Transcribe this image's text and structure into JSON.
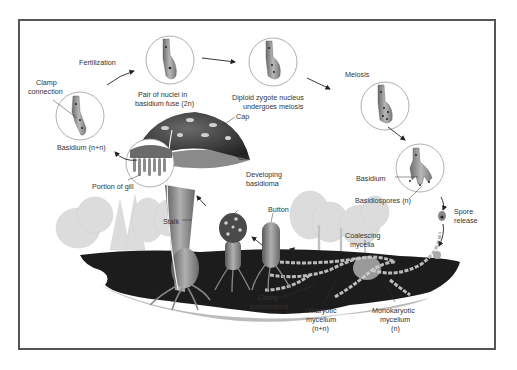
{
  "diagram": {
    "colors": {
      "frame": "#555555",
      "cap": "#3a3a3a",
      "cap_spots": "#c8c8c8",
      "stalk": "#8a8a8a",
      "soil": "#1a1a1a",
      "trees": "#d6d6d6",
      "circle_outline": "#9a9a9a",
      "cell": "#9c9c9c",
      "arrow": "#222222"
    },
    "stages": [
      {
        "id": "fertilization",
        "label": "Fertilization"
      },
      {
        "id": "nuclei-fuse",
        "label_line1": "Pair of nuclei in",
        "label_line2": "basidium fuse (2n)"
      },
      {
        "id": "zygote-meiosis",
        "label_line1": "Diploid zygote nucleus",
        "label_line2": "undergoes meiosis"
      },
      {
        "id": "meiosis",
        "label": "Meiosis"
      },
      {
        "id": "basidium-spores",
        "label_basidium": "Basidium",
        "label_spores": "Basidiospores (n)"
      },
      {
        "id": "spore-release",
        "label_line1": "Spore",
        "label_line2": "release"
      },
      {
        "id": "basidium-dikaryon",
        "label": "Basidium (n+n)"
      },
      {
        "id": "clamp",
        "label_line1": "Clamp",
        "label_line2": "connection"
      }
    ],
    "mushroom_labels": {
      "cap": "Cap",
      "gill": "Gill",
      "portion_of_gill": "Portion of gill",
      "stalk": "Stalk",
      "developing_line1": "Developing",
      "developing_line2": "basidioma",
      "button": "Button"
    },
    "mycelium_labels": {
      "coalescing_line1": "Coalescing",
      "coalescing_line2": "mycelia",
      "clamp_line1": "Clamp",
      "clamp_line2": "connections",
      "dikaryotic_line1": "Dikaryotic",
      "dikaryotic_line2": "mycelium",
      "dikaryotic_line3": "(n+n)",
      "monokaryotic_line1": "Monokaryotic",
      "monokaryotic_line2": "mycelium",
      "monokaryotic_line3": "(n)"
    }
  }
}
